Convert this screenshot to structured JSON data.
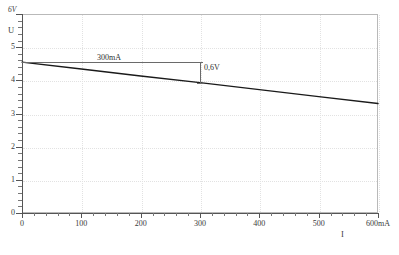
{
  "chart_data": {
    "type": "line",
    "title": "",
    "subtitle": "",
    "xlabel": "I",
    "ylabel": "U",
    "x_unit": "mA",
    "y_unit": "V",
    "xlim": [
      0,
      600
    ],
    "ylim": [
      0,
      6
    ],
    "grid": true,
    "legend": "none",
    "x_major_ticks": [
      0,
      100,
      200,
      300,
      400,
      500,
      600
    ],
    "x_minor_tick_step": 20,
    "y_major_ticks": [
      0,
      1,
      2,
      3,
      4,
      5,
      6
    ],
    "y_minor_tick_step": 0.2,
    "x_tick_labels": [
      "0",
      "100",
      "200",
      "300",
      "400",
      "500",
      "600mA"
    ],
    "y_tick_labels": [
      "0",
      "1",
      "2",
      "3",
      "4",
      "5",
      "6V"
    ],
    "series": [
      {
        "name": "U(I)",
        "color": "#1a1a1a",
        "x": [
          0,
          100,
          200,
          300,
          400,
          500,
          600
        ],
        "values": [
          4.55,
          4.34,
          4.13,
          3.93,
          3.72,
          3.51,
          3.3
        ]
      }
    ],
    "annotations": [
      {
        "id": "current-measure",
        "label": "300mA",
        "kind": "horizontal-span",
        "x_start": 0,
        "x_end": 300,
        "y": 4.55
      },
      {
        "id": "voltage-drop",
        "label": "0,6V",
        "kind": "vertical-span",
        "x": 300,
        "y_start": 4.55,
        "y_end": 3.93
      }
    ]
  },
  "axis": {
    "y_name": "U",
    "y_top_unit": "6V",
    "x_name": "I"
  }
}
